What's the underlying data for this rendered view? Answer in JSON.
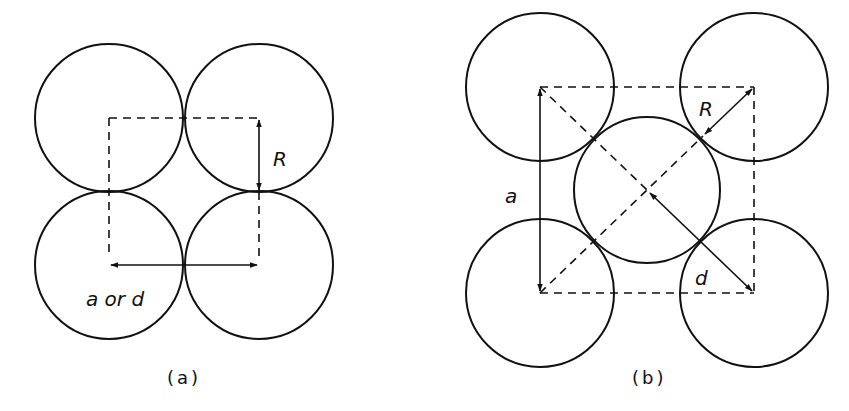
{
  "figure": {
    "colors": {
      "stroke": "#111111",
      "background": "#ffffff"
    }
  },
  "panel_a": {
    "caption": "(a)",
    "labels": {
      "spacing": "a or d",
      "radius": "R"
    },
    "circles": [
      {
        "id": "top-left",
        "cx": 109,
        "cy": 118,
        "r": 74
      },
      {
        "id": "top-right",
        "cx": 259,
        "cy": 118,
        "r": 74
      },
      {
        "id": "bottom-left",
        "cx": 109,
        "cy": 265,
        "r": 74
      },
      {
        "id": "bottom-right",
        "cx": 259,
        "cy": 265,
        "r": 74
      }
    ]
  },
  "panel_b": {
    "caption": "(b)",
    "labels": {
      "lattice": "a",
      "radius": "R",
      "distance": "d"
    },
    "circles": [
      {
        "id": "top-left",
        "cx": 540,
        "cy": 87,
        "r": 74
      },
      {
        "id": "top-right",
        "cx": 754,
        "cy": 87,
        "r": 74
      },
      {
        "id": "bottom-left",
        "cx": 540,
        "cy": 293,
        "r": 74
      },
      {
        "id": "bottom-right",
        "cx": 754,
        "cy": 293,
        "r": 74
      },
      {
        "id": "center",
        "cx": 647,
        "cy": 190,
        "r": 73
      }
    ]
  }
}
